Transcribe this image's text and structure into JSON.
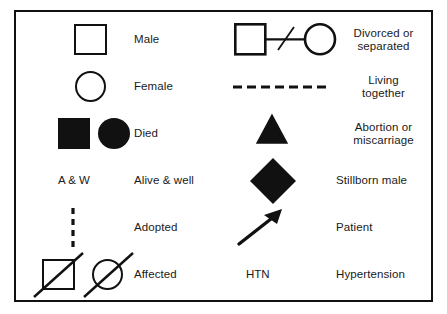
{
  "figure": {
    "kind": "genogram-symbol-legend",
    "border_color": "#111111",
    "ink_color": "#111111",
    "background": "#ffffff"
  },
  "left_column": {
    "rows": [
      {
        "symbol": "open-square",
        "label": "Male"
      },
      {
        "symbol": "open-circle",
        "label": "Female"
      },
      {
        "symbol": "filled-square-and-filled-circle",
        "label": "Died"
      },
      {
        "symbol": "text-abbreviation",
        "symbol_text": "A & W",
        "label": "Alive & well"
      },
      {
        "symbol": "vertical-dashed-line",
        "label": "Adopted"
      },
      {
        "symbol": "slashed-square-and-slashed-circle",
        "label": "Affected"
      }
    ]
  },
  "right_column": {
    "rows": [
      {
        "symbol": "square-line-slash-circle",
        "label": "Divorced or\nseparated"
      },
      {
        "symbol": "horizontal-dashed-line",
        "label": "Living\ntogether"
      },
      {
        "symbol": "filled-triangle",
        "label": "Abortion or\nmiscarriage"
      },
      {
        "symbol": "filled-diamond",
        "label": "Stillborn male"
      },
      {
        "symbol": "diagonal-arrow",
        "label": "Patient"
      },
      {
        "symbol": "text-abbreviation",
        "symbol_text": "HTN",
        "label": "Hypertension"
      }
    ]
  }
}
